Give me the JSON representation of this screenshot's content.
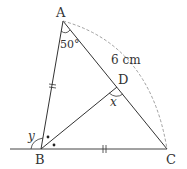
{
  "diagram": {
    "type": "geometry-triangle",
    "points": {
      "A": {
        "label": "A",
        "x": 63,
        "y": 21
      },
      "B": {
        "label": "B",
        "x": 41,
        "y": 149
      },
      "C": {
        "label": "C",
        "x": 167,
        "y": 149
      },
      "D": {
        "label": "D",
        "x": 117,
        "y": 87
      }
    },
    "labels": {
      "A": "A",
      "B": "B",
      "C": "C",
      "D": "D",
      "angle_A": "50°",
      "length_AC": "6 cm",
      "angle_x": "x",
      "angle_y": "y"
    },
    "marks": {
      "AB_equal_BC": "||",
      "angle_bisector_BD": "•"
    },
    "colors": {
      "line": "#333333",
      "dashed_arc": "#888888"
    }
  }
}
